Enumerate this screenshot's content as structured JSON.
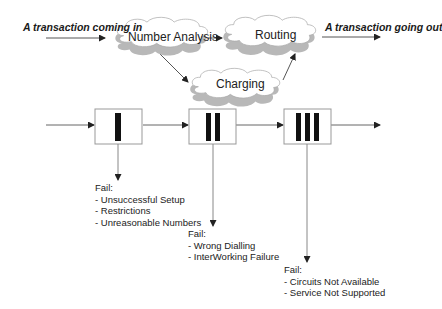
{
  "inputs": {
    "incoming": "A transaction coming in",
    "outgoing": "A transaction going out"
  },
  "clouds": {
    "number_analysis": "Number Analysis",
    "routing": "Routing",
    "charging": "Charging"
  },
  "stages": [
    {
      "id": "I",
      "bars": 1
    },
    {
      "id": "II",
      "bars": 2
    },
    {
      "id": "III",
      "bars": 3
    }
  ],
  "failures": [
    {
      "title": "Fail:",
      "items": [
        "- Unsuccessful Setup",
        "- Restrictions",
        "- Unreasonable Numbers"
      ]
    },
    {
      "title": "Fail:",
      "items": [
        "- Wrong Dialling",
        "- InterWorking Failure"
      ]
    },
    {
      "title": "Fail:",
      "items": [
        "- Circuits Not Available",
        "- Service Not Supported"
      ]
    }
  ],
  "colors": {
    "line": "#555555",
    "box_border": "#999999",
    "bar": "#111111",
    "cloud_shadow": "#b8b8b8",
    "cloud_fill": "#ffffff"
  }
}
